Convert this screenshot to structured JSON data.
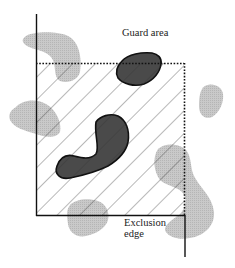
{
  "diagram": {
    "labels": {
      "guard_area": "Guard area",
      "exclusion_edge_line1": "Exclusion",
      "exclusion_edge_line2": "edge"
    },
    "colors": {
      "background": "#ffffff",
      "line": "#1a1a1a",
      "hatch": "#333333",
      "dark_blob_fill": "#4a4a4a",
      "light_blob_fill": "#c4c4c4"
    },
    "regions": [
      {
        "name": "exclusion-region",
        "style": "hatched",
        "bounds": "x 36-185, y 63-215"
      },
      {
        "name": "guard-area-boundary",
        "style": "dotted",
        "edges": [
          "top",
          "right"
        ]
      },
      {
        "name": "exclusion-edge",
        "style": "solid",
        "edges": [
          "left",
          "bottom",
          "right-extension"
        ]
      }
    ],
    "shapes": {
      "dark_blobs": 2,
      "light_blobs": 6
    }
  }
}
